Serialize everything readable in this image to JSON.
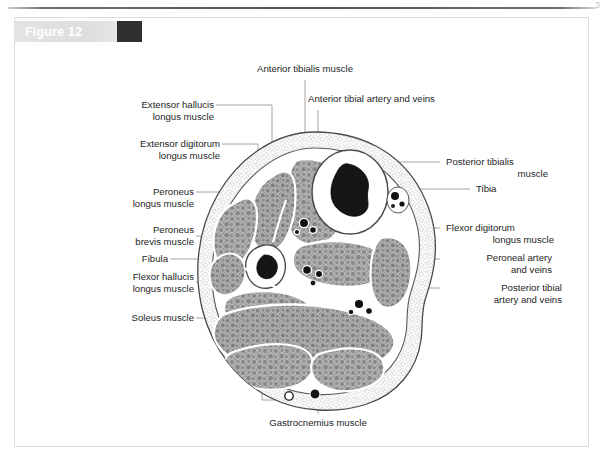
{
  "page": {
    "corner_mark": "3"
  },
  "figure": {
    "label": "Figure 12",
    "swatch_color": "#2f2f2f",
    "bar_color": "#e0e0e0",
    "frame_border_color": "#dcdcdc"
  },
  "labels": {
    "top": [
      {
        "name": "anterior-tibialis-muscle",
        "text": "Anterior tibialis muscle"
      },
      {
        "name": "anterior-tibial-artery-and-veins",
        "text": "Anterior tibial artery and veins"
      }
    ],
    "left": [
      {
        "name": "extensor-hallucis-longus-muscle",
        "line1": "Extensor hallucis",
        "line2": "longus muscle"
      },
      {
        "name": "extensor-digitorum-longus-muscle",
        "line1": "Extensor digitorum",
        "line2": "longus muscle"
      },
      {
        "name": "peroneus-longus-muscle",
        "line1": "Peroneus",
        "line2": "longus muscle"
      },
      {
        "name": "peroneus-brevis-muscle",
        "line1": "Peroneus",
        "line2": "brevis muscle"
      },
      {
        "name": "fibula",
        "line1": "Fibula",
        "line2": ""
      },
      {
        "name": "flexor-hallucis-longus-muscle",
        "line1": "Flexor hallucis",
        "line2": "longus muscle"
      },
      {
        "name": "soleus-muscle",
        "line1": "Soleus muscle",
        "line2": ""
      }
    ],
    "right": [
      {
        "name": "posterior-tibialis-muscle",
        "line1": "Posterior tibialis",
        "line2": "muscle"
      },
      {
        "name": "tibia",
        "line1": "Tibia",
        "line2": ""
      },
      {
        "name": "flexor-digitorum-longus-muscle",
        "line1": "Flexor digitorum",
        "line2": "longus muscle"
      },
      {
        "name": "peroneal-artery-and-veins",
        "line1": "Peroneal artery",
        "line2": "and veins"
      },
      {
        "name": "posterior-tibial-artery-and-veins",
        "line1": "Posterior tibial",
        "line2": "artery and veins"
      }
    ],
    "bottom": [
      {
        "name": "gastrocnemius-muscle",
        "text": "Gastrocnemius muscle"
      }
    ]
  },
  "diagram": {
    "leader_color": "#9a9a9a",
    "muscle_fill": "#8d8d8d",
    "fascia_color": "#ffffff",
    "bone_marrow_color": "#141414",
    "outline_color": "#3a3a3a"
  }
}
